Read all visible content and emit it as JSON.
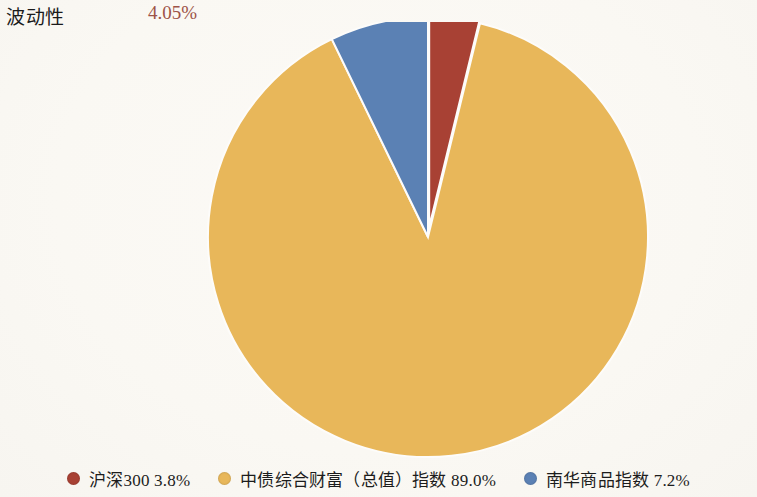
{
  "header": {
    "metric_label": "波动性",
    "metric_value": "4.05%",
    "metric_value_color": "#9d5347"
  },
  "legend": {
    "items": [
      {
        "label": "沪深300 3.8%",
        "color": "#a84134",
        "marker": "dot-icon"
      },
      {
        "label": "中债综合财富（总值）指数 89.0%",
        "color": "#e8b75a",
        "marker": "dot-icon"
      },
      {
        "label": "南华商品指数 7.2%",
        "color": "#5b81b4",
        "marker": "dot-icon"
      }
    ]
  },
  "chart_data": {
    "type": "pie",
    "title": "",
    "subtitle": "",
    "xlabel": "",
    "ylabel": "",
    "legend_position": "bottom",
    "grid": false,
    "start_angle": 90,
    "direction": "clockwise",
    "categories": [
      "沪深300",
      "中债综合财富（总值）指数",
      "南华商品指数"
    ],
    "values": [
      3.8,
      89.0,
      7.2
    ],
    "value_labels": [
      "3.8%",
      "89.0%",
      "7.2%"
    ],
    "colors": [
      "#a84134",
      "#e8b75a",
      "#5b81b4"
    ],
    "exploded": [
      true,
      false,
      false
    ],
    "explode_offset": [
      10,
      0,
      0
    ],
    "annotations": [
      {
        "text": "波动性",
        "value": "4.05%"
      }
    ],
    "geometry": {
      "center_x": 428,
      "center_y": 215,
      "radius": 220
    }
  }
}
